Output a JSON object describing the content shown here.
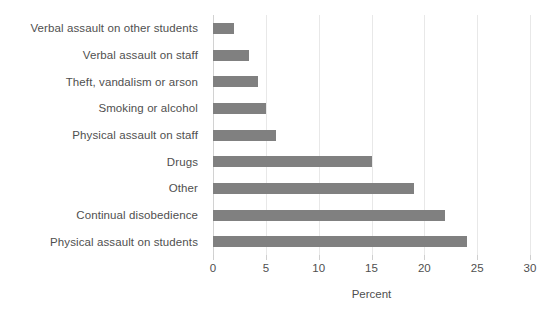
{
  "chart_data": {
    "type": "bar",
    "orientation": "horizontal",
    "title": "",
    "xlabel": "Percent",
    "ylabel": "",
    "xlim": [
      0,
      30
    ],
    "xticks": [
      0,
      5,
      10,
      15,
      20,
      25,
      30
    ],
    "grid": true,
    "legend": null,
    "bar_color": "#808080",
    "categories": [
      "Verbal assault on other students",
      "Verbal assault on staff",
      "Theft, vandalism or arson",
      "Smoking or alcohol",
      "Physical assault on staff",
      "Drugs",
      "Other",
      "Continual disobedience",
      "Physical assault on students"
    ],
    "values": [
      2,
      3.4,
      4.3,
      5,
      6,
      15,
      19,
      22,
      24
    ]
  }
}
